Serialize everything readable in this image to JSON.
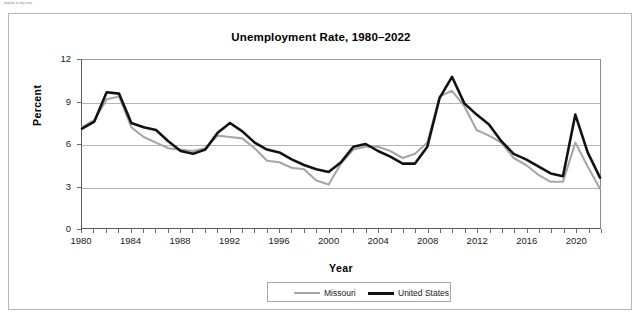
{
  "footnote_scrap": "may be of any race.",
  "figure": {
    "title": "Unemployment Rate, 1980–2022",
    "x_axis_title": "Year",
    "y_axis_title": "Percent"
  },
  "legend": {
    "position": "bottom-center",
    "entries": [
      {
        "label": "Missouri",
        "color": "#a6a6a6",
        "width": 2.2
      },
      {
        "label": "United States",
        "color": "#121212",
        "width": 3.2
      }
    ]
  },
  "axes": {
    "y_ticks": [
      "0",
      "3",
      "6",
      "9",
      "12"
    ],
    "x_ticks": [
      "1980",
      "1984",
      "1988",
      "1992",
      "1996",
      "2000",
      "2004",
      "2008",
      "2012",
      "2016",
      "2020"
    ]
  },
  "chart_data": {
    "type": "line",
    "title": "Unemployment Rate, 1980–2022",
    "xlabel": "Year",
    "ylabel": "Percent",
    "xlim": [
      1980,
      2022
    ],
    "ylim": [
      0,
      12
    ],
    "y_ticks": [
      0,
      3,
      6,
      9,
      12
    ],
    "x_ticks": [
      1980,
      1984,
      1988,
      1992,
      1996,
      2000,
      2004,
      2008,
      2012,
      2016,
      2020
    ],
    "grid": "horizontal",
    "legend_position": "bottom-center",
    "x": [
      1980,
      1981,
      1982,
      1983,
      1984,
      1985,
      1986,
      1987,
      1988,
      1989,
      1990,
      1991,
      1992,
      1993,
      1994,
      1995,
      1996,
      1997,
      1998,
      1999,
      2000,
      2001,
      2002,
      2003,
      2004,
      2005,
      2006,
      2007,
      2008,
      2009,
      2010,
      2011,
      2012,
      2013,
      2014,
      2015,
      2016,
      2017,
      2018,
      2019,
      2020,
      2021,
      2022
    ],
    "series": [
      {
        "name": "Missouri",
        "color": "#a6a6a6",
        "values": [
          7.2,
          7.7,
          9.2,
          9.4,
          7.2,
          6.5,
          6.1,
          5.7,
          5.6,
          5.5,
          5.7,
          6.6,
          6.5,
          6.4,
          5.7,
          4.8,
          4.7,
          4.3,
          4.2,
          3.4,
          3.1,
          4.6,
          5.6,
          5.8,
          5.8,
          5.5,
          5.0,
          5.3,
          6.1,
          9.4,
          9.8,
          8.7,
          7.0,
          6.6,
          6.1,
          5.0,
          4.5,
          3.8,
          3.3,
          3.3,
          6.1,
          4.4,
          2.8
        ]
      },
      {
        "name": "United States",
        "color": "#121212",
        "values": [
          7.1,
          7.6,
          9.7,
          9.6,
          7.5,
          7.2,
          7.0,
          6.2,
          5.5,
          5.3,
          5.6,
          6.8,
          7.5,
          6.9,
          6.1,
          5.6,
          5.4,
          4.9,
          4.5,
          4.2,
          4.0,
          4.7,
          5.8,
          6.0,
          5.5,
          5.1,
          4.6,
          4.6,
          5.8,
          9.3,
          10.8,
          8.9,
          8.1,
          7.4,
          6.2,
          5.3,
          4.9,
          4.4,
          3.9,
          3.7,
          8.1,
          5.4,
          3.6
        ]
      }
    ]
  }
}
